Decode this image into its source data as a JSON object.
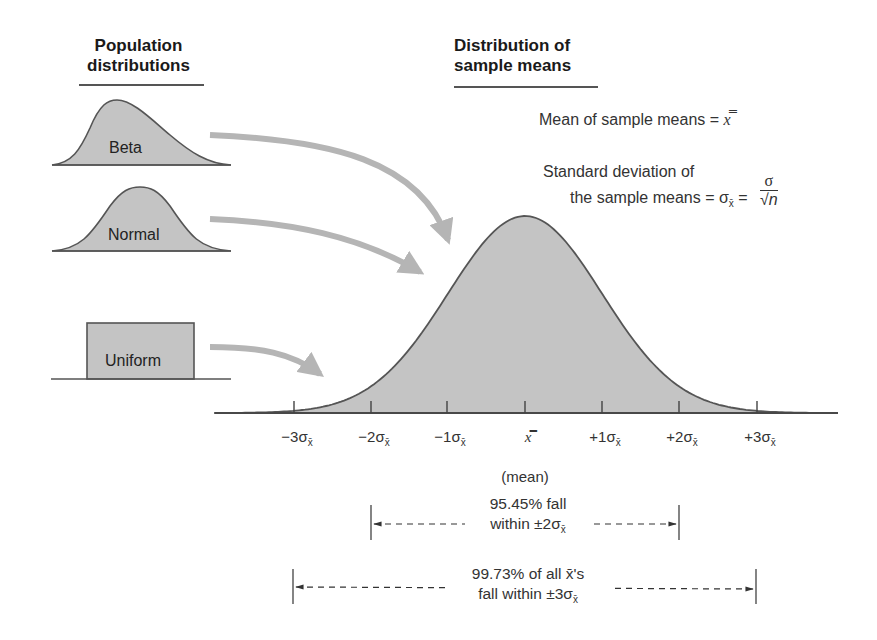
{
  "headings": {
    "population": [
      "Population",
      "distributions"
    ],
    "sample_means": [
      "Distribution of",
      "sample means"
    ]
  },
  "formulas": {
    "mean_label": "Mean of sample means = ",
    "mean_symbol": "x̿",
    "sd_line1": "Standard deviation of",
    "sd_line2": "the sample means = σ",
    "sd_sub": "x̄",
    "sd_eq": " = ",
    "sd_num": "σ",
    "sd_den": "√n"
  },
  "population_shapes": [
    {
      "name": "Beta",
      "type": "right-skewed"
    },
    {
      "name": "Normal",
      "type": "bell"
    },
    {
      "name": "Uniform",
      "type": "rectangle"
    }
  ],
  "axis": {
    "ticks": [
      {
        "label": "−3σ",
        "sub": "x̄",
        "x": 294
      },
      {
        "label": "−2σ",
        "sub": "x̄",
        "x": 371
      },
      {
        "label": "−1σ",
        "sub": "x̄",
        "x": 447
      },
      {
        "label": "x̿",
        "sub": "",
        "x": 525
      },
      {
        "label": "+1σ",
        "sub": "x̄",
        "x": 602
      },
      {
        "label": "+2σ",
        "sub": "x̄",
        "x": 679
      },
      {
        "label": "+3σ",
        "sub": "x̄",
        "x": 757
      }
    ],
    "mean_caption": "(mean)"
  },
  "ranges": {
    "two_sigma": {
      "line1": "95.45% fall",
      "line2": "within ±2σ",
      "sub": "x̄"
    },
    "three_sigma": {
      "line1": "99.73% of all x̄'s",
      "line2": "fall within ±3σ",
      "sub": "x̄"
    }
  },
  "colors": {
    "fill": "#c4c4c4",
    "outline": "#555555",
    "arrow": "#b5b5b5",
    "text": "#222222"
  }
}
